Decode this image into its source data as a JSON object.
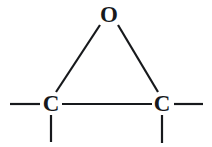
{
  "figure": {
    "kind": "chemical-structure-diagram",
    "name": "epoxide-oxirane-ring",
    "width": 212,
    "height": 147,
    "background_color": "#ffffff",
    "stroke_color": "#17191c"
  },
  "atoms": [
    {
      "id": "oxygen",
      "label": "O",
      "element": "O",
      "x": 109,
      "y": 14,
      "font_size": 23
    },
    {
      "id": "carbon-left",
      "label": "C",
      "element": "C",
      "x": 51,
      "y": 103,
      "font_size": 23
    },
    {
      "id": "carbon-right",
      "label": "C",
      "element": "C",
      "x": 162,
      "y": 103,
      "font_size": 23
    }
  ],
  "bonds": [
    {
      "id": "bond-o-c-left",
      "from": "oxygen",
      "to": "carbon-left",
      "order": 1,
      "x1": 100,
      "y1": 25,
      "x2": 56,
      "y2": 92,
      "width": 2.2
    },
    {
      "id": "bond-o-c-right",
      "from": "oxygen",
      "to": "carbon-right",
      "order": 1,
      "x1": 118,
      "y1": 25,
      "x2": 158,
      "y2": 92,
      "width": 2.2
    },
    {
      "id": "bond-c-c",
      "from": "carbon-left",
      "to": "carbon-right",
      "order": 1,
      "x1": 62,
      "y1": 104,
      "x2": 152,
      "y2": 104,
      "width": 2.2
    },
    {
      "id": "bond-stub-left",
      "from": "carbon-left",
      "to": "substituent-left",
      "order": 1,
      "x1": 10,
      "y1": 104,
      "x2": 40,
      "y2": 104,
      "width": 2.2
    },
    {
      "id": "bond-stub-right",
      "from": "carbon-right",
      "to": "substituent-right",
      "order": 1,
      "x1": 174,
      "y1": 104,
      "x2": 203,
      "y2": 104,
      "width": 2.2
    },
    {
      "id": "bond-stub-down-left",
      "from": "carbon-left",
      "to": "substituent-down-left",
      "order": 1,
      "x1": 51,
      "y1": 115,
      "x2": 51,
      "y2": 142,
      "width": 2.2
    },
    {
      "id": "bond-stub-down-right",
      "from": "carbon-right",
      "to": "substituent-down-right",
      "order": 1,
      "x1": 162,
      "y1": 115,
      "x2": 162,
      "y2": 143,
      "width": 2.2
    }
  ]
}
